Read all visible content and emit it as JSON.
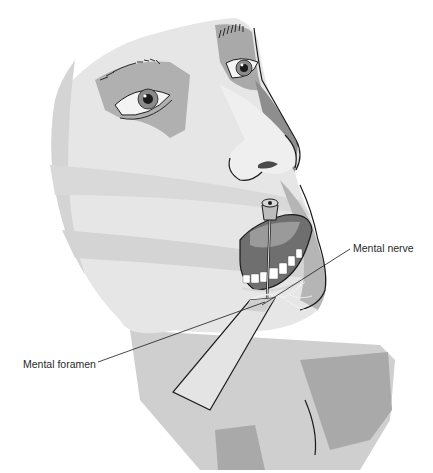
{
  "figure": {
    "colors": {
      "skin_light": "#e6e6e6",
      "skin_mid": "#cfcfcf",
      "skin_shadow": "#a9a9a9",
      "skin_dark": "#8e8e8e",
      "outline": "#1a1a1a",
      "background": "#ffffff"
    }
  },
  "labels": {
    "mental_nerve": "Mental nerve",
    "mental_foramen": "Mental foramen"
  }
}
